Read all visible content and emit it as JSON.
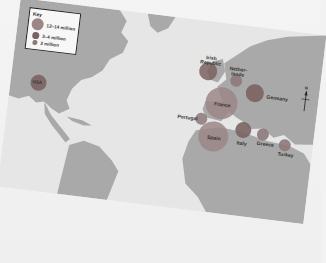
{
  "map": {
    "key": {
      "title": "Key",
      "items": [
        {
          "label": "12–14 million",
          "color": "#9c8686",
          "size": "large"
        },
        {
          "label": "3–4 million",
          "color": "#7a6262",
          "size": "medium"
        },
        {
          "label": "2 million",
          "color": "#8d7878",
          "size": "small"
        }
      ]
    },
    "compass": {
      "north": "N"
    },
    "countries": [
      {
        "name": "USA",
        "label": "USA",
        "category": "3–4 million"
      },
      {
        "name": "Irish Republic",
        "label_line1": "Irish",
        "label_line2": "Republic",
        "category": "3–4 million"
      },
      {
        "name": "Netherlands",
        "label_line1": "Nether-",
        "label_line2": "lands",
        "category": "2 million"
      },
      {
        "name": "Germany",
        "label": "Germany",
        "category": "3–4 million"
      },
      {
        "name": "France",
        "label": "France",
        "category": "12–14 million"
      },
      {
        "name": "Portugal",
        "label": "Portugal",
        "category": "2 million"
      },
      {
        "name": "Spain",
        "label": "Spain",
        "category": "12–14 million"
      },
      {
        "name": "Italy",
        "label": "Italy",
        "category": "3–4 million"
      },
      {
        "name": "Greece",
        "label": "Greece",
        "category": "2 million"
      },
      {
        "name": "Turkey",
        "label": "Turkey",
        "category": "2 million"
      }
    ],
    "colors": {
      "land": "#a9a9a9",
      "sea": "#e6e6e6",
      "circle_large": "#9c8686",
      "circle_medium": "#7a6262",
      "circle_small": "#8d7878"
    }
  }
}
